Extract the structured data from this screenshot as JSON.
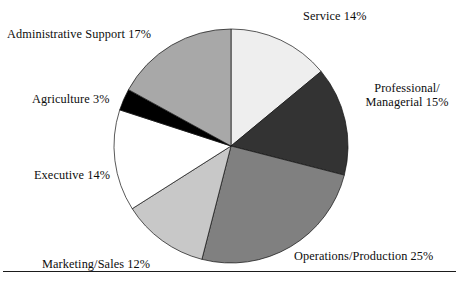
{
  "figure": {
    "name": "occupation-distribution-pie-chart",
    "background_color": "#ffffff",
    "rule_color": "#1b1b1b"
  },
  "chart_data": {
    "type": "pie",
    "title": "",
    "subtitle": "",
    "xlabel": "",
    "ylabel": "",
    "legend_position": "none",
    "grid": false,
    "start_angle_deg": 0,
    "direction": "clockwise",
    "center": {
      "x": 231,
      "y": 146
    },
    "radius": 117,
    "total_percent": 100,
    "categories": [
      "Service",
      "Professional/Managerial",
      "Operations/Production",
      "Marketing/Sales",
      "Executive",
      "Agriculture",
      "Administrative Support"
    ],
    "values": [
      14,
      15,
      25,
      12,
      14,
      3,
      17
    ],
    "colors": [
      "#eeeeee",
      "#333333",
      "#808080",
      "#c8c8c8",
      "#ffffff",
      "#000000",
      "#a8a8a8"
    ],
    "slices": [
      {
        "label": "Service",
        "value": 14,
        "percent_text": "14%",
        "label_text": "Service 14%",
        "color": "#eeeeee",
        "start_deg": 0,
        "end_deg": 50.4
      },
      {
        "label": "Professional/Managerial",
        "value": 15,
        "percent_text": "15%",
        "label_text": "Professional/ Managerial 15%",
        "label_line1": "Professional/",
        "label_line2": "Managerial 15%",
        "color": "#333333",
        "start_deg": 50.4,
        "end_deg": 104.4
      },
      {
        "label": "Operations/Production",
        "value": 25,
        "percent_text": "25%",
        "label_text": "Operations/Production 25%",
        "color": "#808080",
        "start_deg": 104.4,
        "end_deg": 194.4
      },
      {
        "label": "Marketing/Sales",
        "value": 12,
        "percent_text": "12%",
        "label_text": "Marketing/Sales 12%",
        "color": "#c8c8c8",
        "start_deg": 194.4,
        "end_deg": 237.6
      },
      {
        "label": "Executive",
        "value": 14,
        "percent_text": "14%",
        "label_text": "Executive 14%",
        "color": "#ffffff",
        "start_deg": 237.6,
        "end_deg": 288.0
      },
      {
        "label": "Agriculture",
        "value": 3,
        "percent_text": "3%",
        "label_text": "Agriculture 3%",
        "color": "#000000",
        "start_deg": 288.0,
        "end_deg": 298.8
      },
      {
        "label": "Administrative Support",
        "value": 17,
        "percent_text": "17%",
        "label_text": "Administrative Support 17%",
        "color": "#a8a8a8",
        "start_deg": 298.8,
        "end_deg": 360.0
      }
    ]
  }
}
